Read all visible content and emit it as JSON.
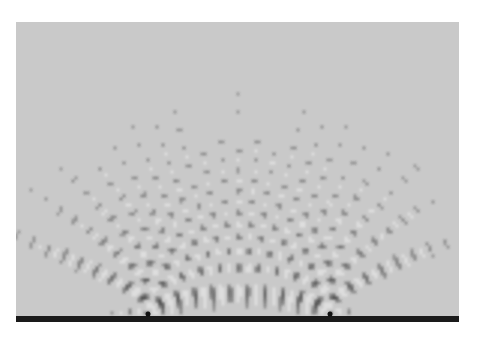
{
  "figure": {
    "panel": {
      "x": 16,
      "y": 22,
      "width": 443,
      "height": 294,
      "background": "#c9c9c9"
    },
    "barrier": {
      "x": 16,
      "y": 316,
      "width": 443,
      "height": 6,
      "color": "#1a1a1a"
    },
    "sources": [
      {
        "x": 148,
        "y": 314
      },
      {
        "x": 330,
        "y": 314
      }
    ],
    "wavelength": 17,
    "dark_color": "#3a3a3a",
    "light_color": "#eeeeee"
  }
}
